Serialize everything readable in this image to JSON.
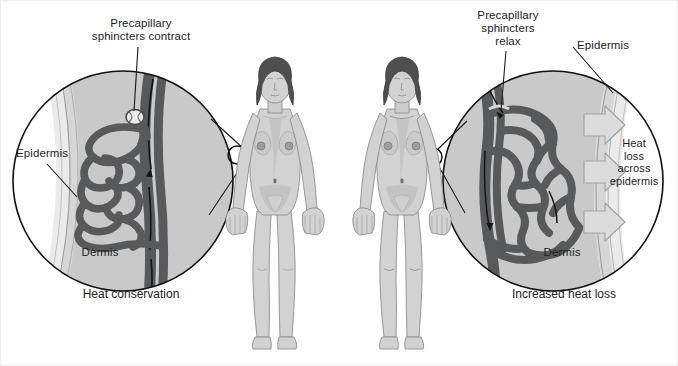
{
  "figure": {
    "background_color": "#ffffff"
  },
  "panels": [
    {
      "id": "left",
      "caption": "Heat conservation",
      "callout_label": "Precapillary\nsphincters contract",
      "epidermis_label": "Epidermis",
      "dermis_label": "Dermis",
      "state": "constricted"
    },
    {
      "id": "right",
      "caption": "Increased heat loss",
      "callout_label": "Precapillary\nsphincters\nrelax",
      "epidermis_label": "Epidermis",
      "dermis_label": "Dermis",
      "heat_loss_label": "Heat\nloss\nacross\nepidermis",
      "state": "dilated"
    }
  ],
  "colors": {
    "vessel": "#58595b",
    "dermis": "#c9c9c9",
    "epidermis": "#e4e4e4",
    "subcutis": "#d8d8d8",
    "skin": "#d4d4d4",
    "skin_shadow": "#b9b9b9",
    "hair": "#4d4d4d",
    "outline": "#111111",
    "arrow_fill": "#dcdcdc",
    "arrow_stroke": "#9a9a9a"
  }
}
